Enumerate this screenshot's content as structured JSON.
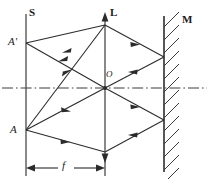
{
  "figure": {
    "width": 209,
    "height": 189,
    "background_color": "#ffffff",
    "line_color": "#2b2b2b",
    "labels": {
      "screen": "S",
      "lens": "L",
      "mirror": "M",
      "image_point": "A'",
      "object_point": "A",
      "optical_center": "O",
      "focal_length": "f"
    },
    "elements": {
      "screen_line": {
        "name": "S",
        "x": 26,
        "y_top": 14,
        "y_bottom": 176,
        "style": "solid-vertical"
      },
      "lens_line": {
        "name": "L",
        "x": 105,
        "y_top": 21,
        "y_bottom": 176,
        "style": "solid-vertical-double-arrow"
      },
      "mirror_line": {
        "name": "M",
        "x": 164,
        "y_top": 16,
        "y_bottom": 172,
        "style": "solid-vertical-hatched"
      },
      "optical_axis": {
        "y": 88,
        "x_start": 2,
        "x_end": 207,
        "style": "dash-dot"
      },
      "optical_center": {
        "x": 105,
        "y": 88
      },
      "object_point": {
        "x": 26,
        "y": 130
      },
      "image_point": {
        "x": 26,
        "y": 43
      },
      "lens_top_aperture": {
        "x": 105,
        "y": 25
      },
      "lens_bottom_aperture": {
        "x": 105,
        "y": 152
      },
      "mirror_upper_hit": {
        "x": 164,
        "y": 57
      },
      "mirror_lower_hit": {
        "x": 164,
        "y": 120
      },
      "focal_dimension": {
        "y": 168,
        "x_start": 26,
        "x_end": 105,
        "label": "f"
      }
    },
    "ray_paths": [
      {
        "name": "ray-A-to-lens-top",
        "from": "object_point",
        "to": "lens_top_aperture",
        "direction": "rightward"
      },
      {
        "name": "ray-A-to-optical-center",
        "from": "object_point",
        "to": "optical_center",
        "direction": "rightward"
      },
      {
        "name": "ray-A-to-lens-bottom",
        "from": "object_point",
        "to": "lens_bottom_aperture",
        "direction": "rightward"
      },
      {
        "name": "ray-lens-top-to-mirror-lower",
        "from": "lens_top_aperture",
        "to": "mirror_lower_hit",
        "direction": "rightward"
      },
      {
        "name": "ray-center-to-mirror-upper",
        "from": "optical_center",
        "to": "mirror_upper_hit",
        "direction": "rightward"
      },
      {
        "name": "ray-lens-bottom-to-mirror-lower",
        "from": "lens_bottom_aperture",
        "to": "mirror_lower_hit",
        "direction": "rightward"
      },
      {
        "name": "ray-mirror-upper-to-lens-top",
        "from": "mirror_upper_hit",
        "to": "lens_top_aperture",
        "direction": "leftward"
      },
      {
        "name": "ray-mirror-upper-to-center",
        "from": "mirror_upper_hit",
        "to": "optical_center",
        "direction": "leftward"
      },
      {
        "name": "ray-lens-top-to-Aprime",
        "from": "lens_top_aperture",
        "to": "image_point",
        "direction": "leftward"
      },
      {
        "name": "ray-center-to-Aprime",
        "from": "optical_center",
        "to": "image_point",
        "direction": "leftward"
      },
      {
        "name": "ray-lens-bottom-to-A",
        "from": "lens_bottom_aperture",
        "to": "object_point",
        "direction": "leftward"
      }
    ]
  }
}
